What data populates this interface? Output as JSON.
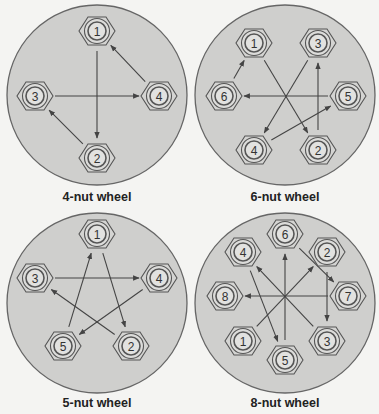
{
  "colors": {
    "background": "#f4f4f2",
    "wheel_fill": "#cfcfcd",
    "wheel_stroke": "#666666",
    "nut_fill": "#d4d4d2",
    "nut_stroke": "#555555",
    "arrow": "#444444",
    "label": "#222222"
  },
  "wheels": [
    {
      "id": "4-nut",
      "caption": "4-nut wheel",
      "center": [
        97,
        95
      ],
      "radius": 90,
      "nuts": [
        {
          "label": "1",
          "x": 97,
          "y": 31
        },
        {
          "label": "2",
          "x": 97,
          "y": 158
        },
        {
          "label": "3",
          "x": 35,
          "y": 96
        },
        {
          "label": "4",
          "x": 159,
          "y": 96
        }
      ],
      "sequence": [
        "1",
        "2",
        "3",
        "4",
        "1"
      ]
    },
    {
      "id": "6-nut",
      "caption": "6-nut wheel",
      "center": [
        285,
        95
      ],
      "radius": 90,
      "nuts": [
        {
          "label": "1",
          "x": 254,
          "y": 43
        },
        {
          "label": "2",
          "x": 318,
          "y": 150
        },
        {
          "label": "3",
          "x": 318,
          "y": 43
        },
        {
          "label": "4",
          "x": 254,
          "y": 150
        },
        {
          "label": "5",
          "x": 348,
          "y": 96
        },
        {
          "label": "6",
          "x": 224,
          "y": 96
        }
      ],
      "sequence": [
        "1",
        "2",
        "3",
        "4",
        "5",
        "6",
        "1"
      ]
    },
    {
      "id": "5-nut",
      "caption": "5-nut wheel",
      "center": [
        97,
        303
      ],
      "radius": 90,
      "nuts": [
        {
          "label": "1",
          "x": 97,
          "y": 234
        },
        {
          "label": "2",
          "x": 131,
          "y": 346
        },
        {
          "label": "3",
          "x": 35,
          "y": 278
        },
        {
          "label": "4",
          "x": 159,
          "y": 278
        },
        {
          "label": "5",
          "x": 63,
          "y": 346
        }
      ],
      "sequence": [
        "1",
        "2",
        "3",
        "4",
        "5",
        "1"
      ]
    },
    {
      "id": "8-nut",
      "caption": "8-nut wheel",
      "center": [
        285,
        303
      ],
      "radius": 90,
      "nuts": [
        {
          "label": "1",
          "x": 243,
          "y": 341
        },
        {
          "label": "2",
          "x": 327,
          "y": 252
        },
        {
          "label": "3",
          "x": 327,
          "y": 341
        },
        {
          "label": "4",
          "x": 243,
          "y": 252
        },
        {
          "label": "5",
          "x": 285,
          "y": 360
        },
        {
          "label": "6",
          "x": 285,
          "y": 234
        },
        {
          "label": "7",
          "x": 348,
          "y": 296
        },
        {
          "label": "8",
          "x": 225,
          "y": 296
        }
      ],
      "sequence": [
        "1",
        "2",
        "3",
        "4",
        "5",
        "6",
        "7",
        "8"
      ]
    }
  ]
}
